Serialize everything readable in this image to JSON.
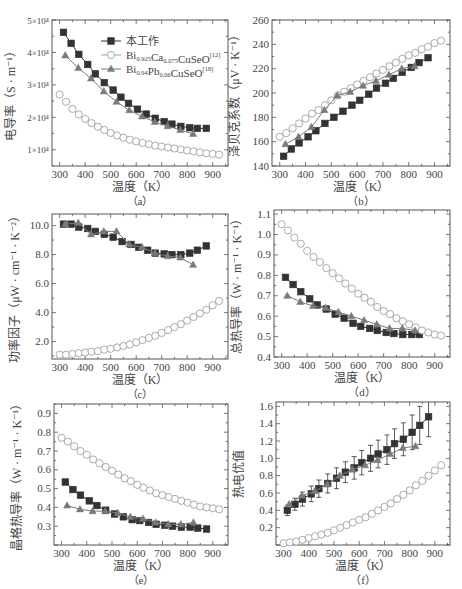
{
  "figure": {
    "legend": {
      "entries": [
        {
          "label": "本工作",
          "marker": "filled-square",
          "color": "#333333"
        },
        {
          "label_main": "Bi",
          "sub1": "0.925",
          "mid": "Ca",
          "sub2": "0.075",
          "tail": "CuSeO",
          "ref": "[12]",
          "marker": "open-circle",
          "color": "#9a9a9a"
        },
        {
          "label_main": "Bi",
          "sub1": "0.94",
          "mid": "Pb",
          "sub2": "0.06",
          "tail": "CuSeO",
          "ref": "[18]",
          "marker": "filled-triangle",
          "color": "#777777"
        }
      ]
    },
    "colors": {
      "this_work": "#333333",
      "ca_doped": "#a0a0a0",
      "pb_doped": "#7a7a7a",
      "axis": "#555555"
    }
  },
  "chart_data": [
    {
      "id": "a",
      "panel_label": "（a）",
      "type": "line",
      "title": "",
      "xlabel": "温度（K）",
      "ylabel": "电导率（S · m⁻¹）",
      "xlim": [
        270,
        960
      ],
      "ylim": [
        5000,
        50000
      ],
      "xticks": [
        300,
        400,
        500,
        600,
        700,
        800,
        900
      ],
      "yticks": [
        10000,
        20000,
        30000,
        40000,
        50000
      ],
      "ytick_labels": [
        "1×10⁴",
        "2×10⁴",
        "3×10⁴",
        "4×10⁴",
        "5×10⁴"
      ],
      "series": [
        {
          "name": "本工作",
          "marker": "square",
          "x": [
            315,
            345,
            375,
            410,
            440,
            475,
            510,
            540,
            570,
            605,
            640,
            675,
            710,
            740,
            775,
            810,
            840,
            875
          ],
          "y": [
            46200,
            42800,
            39400,
            36300,
            33400,
            30700,
            28400,
            26200,
            24300,
            22500,
            21000,
            19700,
            18700,
            17900,
            17200,
            16800,
            16600,
            16600
          ]
        },
        {
          "name": "Bi0.925Ca0.075CuSeO[12]",
          "marker": "circle",
          "x": [
            300,
            325,
            350,
            375,
            400,
            425,
            450,
            475,
            500,
            525,
            550,
            575,
            600,
            625,
            650,
            675,
            700,
            725,
            750,
            775,
            800,
            825,
            850,
            875,
            900,
            925
          ],
          "y": [
            27000,
            24800,
            22600,
            20900,
            19500,
            18200,
            17100,
            16100,
            15200,
            14400,
            13700,
            13100,
            12600,
            12100,
            11700,
            11300,
            11000,
            10700,
            10400,
            10100,
            9800,
            9500,
            9200,
            8900,
            8700,
            8500
          ]
        },
        {
          "name": "Bi0.94Pb0.06CuSeO[18]",
          "marker": "triangle",
          "x": [
            322,
            373,
            423,
            473,
            523,
            573,
            623,
            673,
            723,
            773,
            823
          ],
          "y": [
            39100,
            35200,
            32000,
            28000,
            24800,
            22200,
            20300,
            18600,
            17300,
            16100,
            14900
          ]
        }
      ]
    },
    {
      "id": "b",
      "panel_label": "（b）",
      "type": "line",
      "xlabel": "温度（K）",
      "ylabel": "泽贝克系数（μV · K⁻¹）",
      "xlim": [
        270,
        960
      ],
      "ylim": [
        140,
        260
      ],
      "xticks": [
        300,
        400,
        500,
        600,
        700,
        800,
        900
      ],
      "yticks": [
        140,
        160,
        180,
        200,
        220,
        240,
        260
      ],
      "ytick_labels": [
        "140",
        "160",
        "180",
        "200",
        "220",
        "240",
        "260"
      ],
      "series": [
        {
          "name": "本工作",
          "marker": "square",
          "x": [
            315,
            345,
            375,
            410,
            440,
            475,
            510,
            545,
            580,
            610,
            645,
            675,
            710,
            740,
            775,
            810,
            840,
            875
          ],
          "y": [
            148,
            154,
            159,
            164,
            169,
            175,
            180,
            185,
            190,
            194,
            199,
            204,
            208,
            212,
            217,
            221,
            225,
            229
          ]
        },
        {
          "name": "Bi0.925Ca0.075CuSeO[12]",
          "marker": "circle",
          "x": [
            300,
            325,
            350,
            375,
            400,
            425,
            450,
            475,
            500,
            525,
            550,
            575,
            600,
            625,
            650,
            675,
            700,
            725,
            750,
            775,
            800,
            825,
            850,
            875,
            900,
            925
          ],
          "y": [
            164,
            167,
            171,
            175,
            179,
            183,
            186,
            190,
            194,
            198,
            201,
            204,
            207,
            210,
            213,
            216,
            219,
            222,
            225,
            228,
            231,
            233,
            236,
            238,
            241,
            243
          ]
        },
        {
          "name": "Bi0.94Pb0.06CuSeO[18]",
          "marker": "triangle",
          "x": [
            322,
            373,
            423,
            473,
            523,
            573,
            623,
            673,
            723,
            773,
            823
          ],
          "y": [
            158,
            164,
            172,
            186,
            198,
            201,
            206,
            210,
            215,
            220,
            222
          ]
        }
      ]
    },
    {
      "id": "c",
      "panel_label": "（c）",
      "type": "line",
      "xlabel": "温度（K）",
      "ylabel": "功率因子（μW · cm⁻¹ · K⁻²）",
      "xlim": [
        270,
        960
      ],
      "ylim": [
        0.8,
        10.8
      ],
      "xticks": [
        300,
        400,
        500,
        600,
        700,
        800,
        900
      ],
      "yticks": [
        2.0,
        4.0,
        6.0,
        8.0,
        10.0
      ],
      "ytick_labels": [
        "2.0",
        "4.0",
        "6.0",
        "8.0",
        "10.0"
      ],
      "series": [
        {
          "name": "本工作",
          "marker": "square",
          "x": [
            315,
            345,
            375,
            410,
            440,
            475,
            510,
            545,
            580,
            610,
            645,
            675,
            710,
            740,
            775,
            810,
            840,
            875
          ],
          "y": [
            10.1,
            10.1,
            9.9,
            9.8,
            9.6,
            9.4,
            9.2,
            8.9,
            8.7,
            8.5,
            8.3,
            8.1,
            8.05,
            8.0,
            8.0,
            8.1,
            8.3,
            8.6
          ]
        },
        {
          "name": "Bi0.925Ca0.075CuSeO[12]",
          "marker": "circle",
          "x": [
            300,
            325,
            350,
            375,
            400,
            425,
            450,
            475,
            500,
            525,
            550,
            575,
            600,
            625,
            650,
            675,
            700,
            725,
            750,
            775,
            800,
            825,
            850,
            875,
            900,
            925
          ],
          "y": [
            1.1,
            1.1,
            1.15,
            1.2,
            1.25,
            1.3,
            1.35,
            1.45,
            1.5,
            1.6,
            1.7,
            1.8,
            1.95,
            2.1,
            2.25,
            2.4,
            2.6,
            2.8,
            3.0,
            3.2,
            3.45,
            3.7,
            3.95,
            4.2,
            4.5,
            4.8
          ]
        },
        {
          "name": "Bi0.94Pb0.06CuSeO[18]",
          "marker": "triangle",
          "x": [
            322,
            373,
            423,
            473,
            523,
            573,
            623,
            673,
            723,
            773,
            823
          ],
          "y": [
            10.1,
            10.2,
            9.4,
            9.6,
            9.6,
            8.7,
            8.5,
            8.1,
            7.9,
            7.8,
            7.3
          ]
        }
      ]
    },
    {
      "id": "d",
      "panel_label": "（d）",
      "type": "line",
      "xlabel": "温度（K）",
      "ylabel": "总热导率（W · m⁻¹ · K⁻¹）",
      "xlim": [
        270,
        960
      ],
      "ylim": [
        0.4,
        1.12
      ],
      "xticks": [
        300,
        400,
        500,
        600,
        700,
        800,
        900
      ],
      "yticks": [
        0.4,
        0.5,
        0.6,
        0.7,
        0.8,
        0.9,
        1.0,
        1.1
      ],
      "ytick_labels": [
        "0.4",
        "0.5",
        "0.6",
        "0.7",
        "0.8",
        "0.9",
        "1.0",
        "1.1"
      ],
      "series": [
        {
          "name": "本工作",
          "marker": "square",
          "x": [
            315,
            345,
            375,
            410,
            440,
            475,
            510,
            545,
            580,
            610,
            645,
            675,
            710,
            740,
            775,
            810,
            840
          ],
          "y": [
            0.79,
            0.755,
            0.72,
            0.685,
            0.655,
            0.635,
            0.61,
            0.59,
            0.565,
            0.55,
            0.54,
            0.53,
            0.52,
            0.515,
            0.51,
            0.51,
            0.51
          ]
        },
        {
          "name": "Bi0.925Ca0.075CuSeO[12]",
          "marker": "circle",
          "x": [
            300,
            325,
            350,
            375,
            400,
            425,
            450,
            475,
            500,
            525,
            550,
            575,
            600,
            625,
            650,
            675,
            700,
            725,
            750,
            775,
            800,
            825,
            850,
            875,
            900,
            925
          ],
          "y": [
            1.05,
            1.02,
            0.985,
            0.955,
            0.92,
            0.89,
            0.865,
            0.835,
            0.81,
            0.785,
            0.76,
            0.735,
            0.71,
            0.69,
            0.67,
            0.645,
            0.625,
            0.61,
            0.59,
            0.575,
            0.56,
            0.545,
            0.53,
            0.52,
            0.51,
            0.505
          ]
        },
        {
          "name": "Bi0.94Pb0.06CuSeO[18]",
          "marker": "triangle",
          "x": [
            322,
            373,
            423,
            473,
            523,
            573,
            623,
            673,
            723,
            773,
            823
          ],
          "y": [
            0.7,
            0.67,
            0.65,
            0.64,
            0.62,
            0.6,
            0.58,
            0.56,
            0.54,
            0.54,
            0.53
          ]
        }
      ]
    },
    {
      "id": "e",
      "panel_label": "（e）",
      "type": "line",
      "xlabel": "温度（K）",
      "ylabel": "晶格热导率（W · m⁻¹ · K⁻¹）",
      "xlim": [
        270,
        960
      ],
      "ylim": [
        0.2,
        0.95
      ],
      "xticks": [
        300,
        400,
        500,
        600,
        700,
        800,
        900
      ],
      "yticks": [
        0.3,
        0.4,
        0.5,
        0.6,
        0.7,
        0.8,
        0.9
      ],
      "ytick_labels": [
        "0.3",
        "0.4",
        "0.5",
        "0.6",
        "0.7",
        "0.8",
        "0.9"
      ],
      "series": [
        {
          "name": "本工作",
          "marker": "square",
          "x": [
            315,
            345,
            375,
            410,
            440,
            475,
            510,
            545,
            580,
            610,
            645,
            675,
            710,
            740,
            775,
            810,
            840,
            875
          ],
          "y": [
            0.535,
            0.495,
            0.465,
            0.435,
            0.41,
            0.385,
            0.365,
            0.35,
            0.335,
            0.33,
            0.32,
            0.31,
            0.305,
            0.3,
            0.295,
            0.295,
            0.29,
            0.285
          ]
        },
        {
          "name": "Bi0.925Ca0.075CuSeO[12]",
          "marker": "circle",
          "x": [
            300,
            325,
            350,
            375,
            400,
            425,
            450,
            475,
            500,
            525,
            550,
            575,
            600,
            625,
            650,
            675,
            700,
            725,
            750,
            775,
            800,
            825,
            850,
            875,
            900,
            925
          ],
          "y": [
            0.77,
            0.75,
            0.725,
            0.7,
            0.68,
            0.655,
            0.635,
            0.615,
            0.595,
            0.575,
            0.555,
            0.54,
            0.52,
            0.505,
            0.49,
            0.475,
            0.465,
            0.455,
            0.445,
            0.435,
            0.425,
            0.415,
            0.405,
            0.4,
            0.395,
            0.39
          ]
        },
        {
          "name": "Bi0.94Pb0.06CuSeO[18]",
          "marker": "triangle",
          "x": [
            322,
            373,
            423,
            473,
            523,
            573,
            623,
            673,
            723,
            773,
            823
          ],
          "y": [
            0.41,
            0.39,
            0.38,
            0.38,
            0.37,
            0.35,
            0.34,
            0.32,
            0.31,
            0.31,
            0.32
          ]
        }
      ]
    },
    {
      "id": "f",
      "panel_label": "（f）",
      "type": "line",
      "xlabel": "温度（K）",
      "ylabel": "热电优值",
      "xlim": [
        270,
        960
      ],
      "ylim": [
        0.0,
        1.65
      ],
      "xticks": [
        300,
        400,
        500,
        600,
        700,
        800,
        900
      ],
      "yticks": [
        0.2,
        0.4,
        0.6,
        0.8,
        1.0,
        1.2,
        1.4,
        1.6
      ],
      "ytick_labels": [
        "0.2",
        "0.4",
        "0.6",
        "0.8",
        "1.0",
        "1.2",
        "1.4",
        "1.6"
      ],
      "series": [
        {
          "name": "本工作",
          "marker": "square",
          "x": [
            315,
            345,
            375,
            410,
            440,
            475,
            510,
            545,
            580,
            610,
            645,
            675,
            710,
            740,
            775,
            810,
            840,
            875
          ],
          "y": [
            0.4,
            0.47,
            0.53,
            0.59,
            0.65,
            0.71,
            0.77,
            0.84,
            0.89,
            0.95,
            1.0,
            1.05,
            1.1,
            1.17,
            1.22,
            1.3,
            1.38,
            1.48
          ],
          "yerr": [
            0.06,
            0.07,
            0.08,
            0.09,
            0.1,
            0.11,
            0.12,
            0.12,
            0.13,
            0.14,
            0.15,
            0.16,
            0.17,
            0.17,
            0.19,
            0.2,
            0.22,
            0.23
          ]
        },
        {
          "name": "Bi0.925Ca0.075CuSeO[12]",
          "marker": "circle",
          "x": [
            300,
            325,
            350,
            375,
            400,
            425,
            450,
            475,
            500,
            525,
            550,
            575,
            600,
            625,
            650,
            675,
            700,
            725,
            750,
            775,
            800,
            825,
            850,
            875,
            900,
            925
          ],
          "y": [
            0.02,
            0.03,
            0.04,
            0.06,
            0.08,
            0.1,
            0.12,
            0.14,
            0.17,
            0.2,
            0.23,
            0.26,
            0.29,
            0.32,
            0.36,
            0.4,
            0.44,
            0.48,
            0.53,
            0.58,
            0.63,
            0.69,
            0.74,
            0.8,
            0.86,
            0.92
          ]
        },
        {
          "name": "Bi0.94Pb0.06CuSeO[18]",
          "marker": "triangle",
          "x": [
            322,
            373,
            423,
            473,
            523,
            573,
            623,
            673,
            723,
            773,
            823
          ],
          "y": [
            0.47,
            0.57,
            0.62,
            0.7,
            0.8,
            0.87,
            0.92,
            0.98,
            1.05,
            1.12,
            1.14
          ]
        }
      ]
    }
  ]
}
